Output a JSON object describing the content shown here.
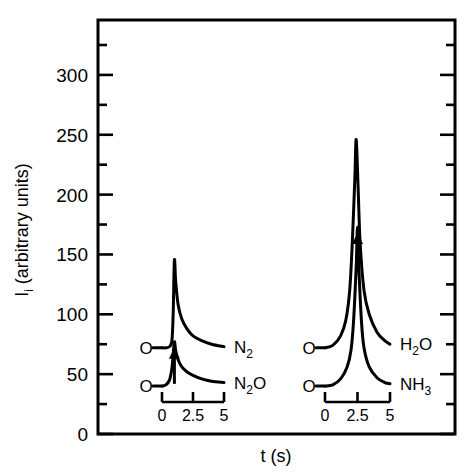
{
  "chart_data": {
    "type": "line",
    "title": "",
    "xlabel": "t (s)",
    "ylabel": "I_i (arbitrary units)",
    "ylabel_main": "I",
    "ylabel_sub": "i",
    "ylabel_rest": " (arbitrary units)",
    "ylim": [
      0,
      325
    ],
    "yticks_major": [
      0,
      50,
      100,
      150,
      200,
      250,
      300
    ],
    "yticks_major_labels": [
      "0",
      "50",
      "100",
      "150",
      "200",
      "250",
      "300"
    ],
    "yticks_minor": [
      25,
      75,
      125,
      175,
      225,
      275,
      325
    ],
    "ytick_step": 25,
    "grid": false,
    "legend_position": "inline-right-of-curve",
    "xlim_inset": [
      0,
      5
    ],
    "inset_xticks": [
      0,
      2.5,
      5
    ],
    "inset_xtick_labels": [
      "0",
      "2.5",
      "5"
    ],
    "annotation_symbol": "O",
    "annotation_note": "Open circle 'O' marks the start of each trace; upward arrow marks the injection time.",
    "groups": [
      {
        "name": "left-group",
        "inset_axis_label_0": "0",
        "inset_axis_label_mid": "2.5",
        "inset_axis_label_end": "5",
        "arrow_time_s": 1.0,
        "series": [
          {
            "name": "N2",
            "label_main": "N",
            "label_sub": "2",
            "label_tail": "",
            "baseline": 72,
            "peak": 145,
            "peak_time_s": 1.0,
            "start_marker": "O",
            "x": [
              0.0,
              0.3,
              0.6,
              0.8,
              0.9,
              1.0,
              1.1,
              1.3,
              1.6,
              2.0,
              2.5,
              3.2,
              4.0,
              5.0
            ],
            "y": [
              72,
              72,
              73,
              78,
              100,
              145,
              128,
              108,
              96,
              88,
              82,
              78,
              75,
              73
            ]
          },
          {
            "name": "N2O",
            "label_main": "N",
            "label_sub": "2",
            "label_tail": "O",
            "baseline": 40,
            "peak": 77,
            "peak_time_s": 1.0,
            "start_marker": "O",
            "x": [
              0.0,
              0.3,
              0.6,
              0.8,
              0.9,
              1.0,
              1.1,
              1.3,
              1.6,
              2.0,
              2.5,
              3.2,
              4.0,
              5.0
            ],
            "y": [
              40,
              41,
              45,
              55,
              66,
              77,
              70,
              62,
              56,
              52,
              49,
              46,
              44,
              43
            ]
          }
        ]
      },
      {
        "name": "right-group",
        "inset_axis_label_0": "0",
        "inset_axis_label_mid": "2.5",
        "inset_axis_label_end": "5",
        "arrow_time_s": 2.5,
        "series": [
          {
            "name": "H2O",
            "label_main": "H",
            "label_sub": "2",
            "label_tail": "O",
            "baseline": 72,
            "peak": 246,
            "peak_time_s": 2.4,
            "start_marker": "O",
            "x": [
              0.0,
              0.6,
              1.2,
              1.6,
              1.9,
              2.1,
              2.3,
              2.4,
              2.55,
              2.7,
              3.0,
              3.4,
              4.0,
              4.6,
              5.0
            ],
            "y": [
              72,
              74,
              82,
              95,
              120,
              160,
              215,
              246,
              205,
              160,
              120,
              100,
              85,
              78,
              75
            ]
          },
          {
            "name": "NH3",
            "label_main": "NH",
            "label_sub": "3",
            "label_tail": "",
            "baseline": 40,
            "peak": 173,
            "peak_time_s": 2.5,
            "start_marker": "O",
            "x": [
              0.0,
              0.6,
              1.2,
              1.7,
              2.0,
              2.2,
              2.4,
              2.5,
              2.6,
              2.8,
              3.0,
              3.4,
              4.0,
              4.6,
              5.0
            ],
            "y": [
              40,
              41,
              46,
              56,
              70,
              95,
              140,
              173,
              140,
              95,
              72,
              56,
              47,
              43,
              42
            ]
          }
        ]
      }
    ]
  }
}
